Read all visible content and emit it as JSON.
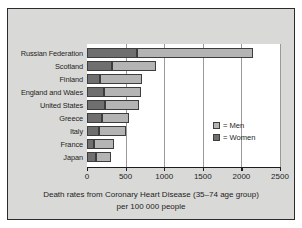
{
  "chart_data": {
    "type": "bar",
    "orientation": "horizontal",
    "stacked": true,
    "title": "",
    "caption_line1": "Death rates from Coronary Heart Disease (35–74 age group)",
    "caption_line2": "per 100 000 people",
    "xlabel": "",
    "ylabel": "",
    "xlim": [
      0,
      2500
    ],
    "xticks": [
      0,
      500,
      1000,
      1500,
      2000,
      2500
    ],
    "xtick_labels": [
      "0",
      "500",
      "1000",
      "1500",
      "2000",
      "2500"
    ],
    "grid": true,
    "grid_axis": "x",
    "legend_position": "inside-right",
    "categories": [
      "Russian Federation",
      "Scotland",
      "Finland",
      "England and Wales",
      "United States",
      "Greece",
      "Italy",
      "France",
      "Japan"
    ],
    "series": [
      {
        "name": "Women",
        "color": "#6f6f6f",
        "values": [
          650,
          320,
          170,
          220,
          230,
          190,
          150,
          95,
          120
        ]
      },
      {
        "name": "Men",
        "color": "#b4b4b4",
        "values": [
          1500,
          580,
          540,
          480,
          440,
          360,
          360,
          250,
          190
        ]
      }
    ],
    "totals": [
      2150,
      900,
      710,
      700,
      670,
      550,
      510,
      345,
      310
    ]
  },
  "legend": {
    "items": [
      {
        "label": "= Men",
        "swatch": "men"
      },
      {
        "label": "= Women",
        "swatch": "women"
      }
    ]
  },
  "colors": {
    "men": "#b4b4b4",
    "women": "#6f6f6f",
    "background": "#d9d9d7",
    "plot_background": "#ffffff",
    "border": "#2b2b2b",
    "gridline": "#9a9a9a",
    "text": "#1d1d1d"
  }
}
